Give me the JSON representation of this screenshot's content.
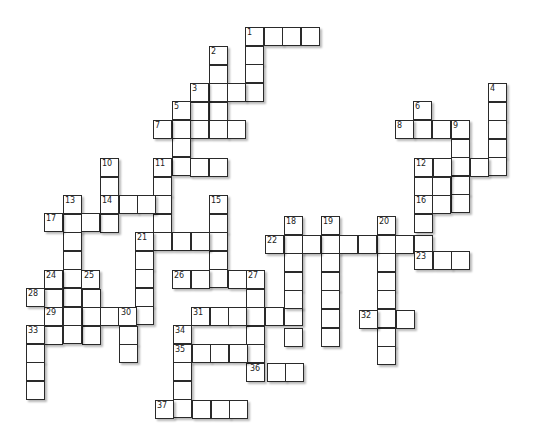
{
  "puzzle": {
    "type": "crossword",
    "cell_size": 18.6,
    "entries": [
      {
        "num": "1",
        "dir": "across",
        "x": 245,
        "y": 27,
        "len": 4
      },
      {
        "num": "1",
        "dir": "down",
        "x": 245,
        "y": 27,
        "len": 4
      },
      {
        "num": "2",
        "dir": "down",
        "x": 209,
        "y": 46,
        "len": 4
      },
      {
        "num": "3",
        "dir": "across",
        "x": 190,
        "y": 83,
        "len": 4
      },
      {
        "num": "3",
        "dir": "down",
        "x": 190,
        "y": 83,
        "len": 3
      },
      {
        "num": "5",
        "dir": "down",
        "x": 172,
        "y": 101,
        "len": 4
      },
      {
        "num": "7",
        "dir": "across",
        "x": 153,
        "y": 120,
        "len": 5
      },
      {
        "num": "11",
        "dir": "across",
        "x": 153,
        "y": 158,
        "len": 4
      },
      {
        "num": "11",
        "dir": "down",
        "x": 153,
        "y": 158,
        "len": 5
      },
      {
        "num": "10",
        "dir": "down",
        "x": 100,
        "y": 158,
        "len": 4
      },
      {
        "num": "14",
        "dir": "across",
        "x": 100,
        "y": 195,
        "len": 4
      },
      {
        "num": "13",
        "dir": "down",
        "x": 63,
        "y": 195,
        "len": 6
      },
      {
        "num": "17",
        "dir": "across",
        "x": 44,
        "y": 213,
        "len": 4
      },
      {
        "num": "15",
        "dir": "down",
        "x": 209,
        "y": 195,
        "len": 5
      },
      {
        "num": "21",
        "dir": "across",
        "x": 135,
        "y": 232,
        "len": 5
      },
      {
        "num": "21",
        "dir": "down",
        "x": 135,
        "y": 232,
        "len": 5
      },
      {
        "num": "26",
        "dir": "across",
        "x": 172,
        "y": 270,
        "len": 5
      },
      {
        "num": "27",
        "dir": "down",
        "x": 246,
        "y": 270,
        "len": 6
      },
      {
        "num": "24",
        "dir": "across",
        "x": 44,
        "y": 270,
        "len": 3
      },
      {
        "num": "24",
        "dir": "down",
        "x": 44,
        "y": 270,
        "len": 4
      },
      {
        "num": "25",
        "dir": "down",
        "x": 82,
        "y": 270,
        "len": 4
      },
      {
        "num": "28",
        "dir": "across",
        "x": 26,
        "y": 288,
        "len": 4
      },
      {
        "num": "29",
        "dir": "across",
        "x": 44,
        "y": 307,
        "len": 6
      },
      {
        "num": "30",
        "dir": "down",
        "x": 119,
        "y": 307,
        "len": 3
      },
      {
        "num": "33",
        "dir": "across",
        "x": 26,
        "y": 325,
        "len": 4
      },
      {
        "num": "33",
        "dir": "down",
        "x": 26,
        "y": 325,
        "len": 4
      },
      {
        "num": "31",
        "dir": "across",
        "x": 191,
        "y": 307,
        "len": 6
      },
      {
        "num": "34",
        "dir": "down",
        "x": 173,
        "y": 325,
        "len": 5
      },
      {
        "num": "35",
        "dir": "across",
        "x": 173,
        "y": 344,
        "len": 5
      },
      {
        "num": "36",
        "dir": "across",
        "x": 248,
        "y": 363,
        "len": 3
      },
      {
        "num": "37",
        "dir": "across",
        "x": 155,
        "y": 400,
        "len": 5
      },
      {
        "num": "18",
        "dir": "down",
        "x": 284,
        "y": 216,
        "len": 7
      },
      {
        "num": "19",
        "dir": "down",
        "x": 321,
        "y": 216,
        "len": 7
      },
      {
        "num": "20",
        "dir": "down",
        "x": 377,
        "y": 216,
        "len": 8
      },
      {
        "num": "22",
        "dir": "across",
        "x": 265,
        "y": 235,
        "len": 9
      },
      {
        "num": "32",
        "dir": "across",
        "x": 359,
        "y": 310,
        "len": 3
      },
      {
        "num": "4",
        "dir": "down",
        "x": 488,
        "y": 83,
        "len": 5
      },
      {
        "num": "6",
        "dir": "down",
        "x": 413,
        "y": 101,
        "len": 2
      },
      {
        "num": "8",
        "dir": "across",
        "x": 395,
        "y": 120,
        "len": 4
      },
      {
        "num": "9",
        "dir": "down",
        "x": 451,
        "y": 120,
        "len": 5
      },
      {
        "num": "12",
        "dir": "across",
        "x": 414,
        "y": 158,
        "len": 5
      },
      {
        "num": "12",
        "dir": "down",
        "x": 414,
        "y": 158,
        "len": 6
      },
      {
        "num": "",
        "dir": "down",
        "x": 432,
        "y": 158,
        "len": 3
      },
      {
        "num": "16",
        "dir": "across",
        "x": 414,
        "y": 195,
        "len": 3
      },
      {
        "num": "23",
        "dir": "across",
        "x": 414,
        "y": 251,
        "len": 3
      }
    ]
  }
}
